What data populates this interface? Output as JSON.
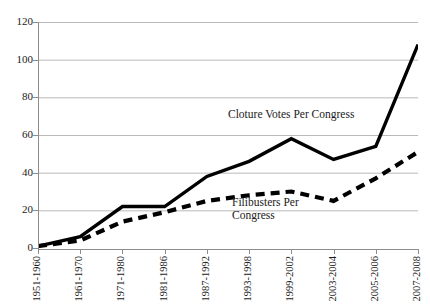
{
  "chart_data": {
    "type": "line",
    "title": "",
    "xlabel": "",
    "ylabel": "",
    "ylim": [
      0,
      120
    ],
    "ytick_step": 20,
    "yticks": [
      "0",
      "20",
      "40",
      "60",
      "80",
      "100",
      "120"
    ],
    "grid": true,
    "legend_position": "inline-annotations",
    "categories": [
      "1951-1960",
      "1961-1970",
      "1971-1980",
      "1981-1986",
      "1987-1992",
      "1993-1998",
      "1999-2002",
      "2003-2004",
      "2005-2006",
      "2007-2008"
    ],
    "series": [
      {
        "name": "Cloture Votes Per Congress",
        "style": "solid",
        "color": "#000000",
        "values": [
          1,
          6,
          22,
          22,
          38,
          46,
          58,
          47,
          54,
          108
        ]
      },
      {
        "name": "Filibusters Per Congress",
        "style": "dashed",
        "color": "#000000",
        "values": [
          1,
          4,
          14,
          19,
          25,
          28,
          30,
          25,
          37,
          51
        ]
      }
    ],
    "annotations": [
      {
        "text": "Cloture Votes Per Congress",
        "series": "Cloture Votes Per Congress"
      },
      {
        "text": "Filibusters Per",
        "series": "Filibusters Per Congress"
      },
      {
        "text": "Congress",
        "series": "Filibusters Per Congress"
      }
    ]
  },
  "labels": {
    "cloture_annotation": "Cloture Votes Per Congress",
    "filibusters_annotation_line1": "Filibusters Per",
    "filibusters_annotation_line2": "Congress"
  }
}
